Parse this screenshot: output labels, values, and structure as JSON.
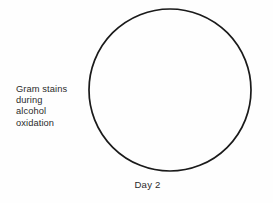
{
  "figure": {
    "type": "hand-drawn-diagram",
    "background_color": "#fefefe",
    "ink_color": "#1a1a1a",
    "text_color": "#2b2b2b"
  },
  "dish": {
    "shape": "circle",
    "center_x": 170,
    "center_y": 90,
    "radius": 81,
    "stroke_width": 1.7,
    "fill": "none",
    "contents": "empty"
  },
  "annotation": {
    "lines": [
      "Gram stains",
      "during",
      "alcohol",
      "oxidation"
    ]
  },
  "caption": {
    "text": "Day 2"
  }
}
